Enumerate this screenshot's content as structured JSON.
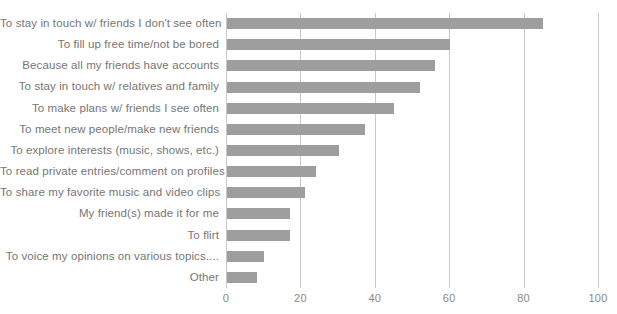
{
  "chart_data": {
    "type": "bar",
    "orientation": "horizontal",
    "title": "",
    "subtitle": "",
    "xlabel": "",
    "ylabel": "",
    "xlim": [
      0,
      100
    ],
    "xticks": [
      0,
      20,
      40,
      60,
      80,
      100
    ],
    "xtick_labels": [
      "0",
      "20",
      "40",
      "60",
      "80",
      "100"
    ],
    "grid": true,
    "grid_axis": "x",
    "legend": false,
    "legend_position": "none",
    "bar_color": "#9e9e9e",
    "grid_color": "#c9c9c9",
    "label_color": "#767676",
    "background": "#ffffff",
    "categories": [
      "To stay in touch w/ friends I don't see often",
      "To fill up free time/not be bored",
      "Because all my friends have accounts",
      "To stay in touch w/ relatives and family",
      "To make plans w/ friends I see often",
      "To meet new people/make new friends",
      "To explore interests (music, shows, etc.)",
      "To read private entries/comment on profiles",
      "To share my favorite music and video clips",
      "My friend(s) made it for me",
      "To flirt",
      "To voice my opinions on various topics....",
      "Other"
    ],
    "values": [
      85,
      60,
      56,
      52,
      45,
      37,
      30,
      24,
      21,
      17,
      17,
      10,
      8
    ]
  }
}
